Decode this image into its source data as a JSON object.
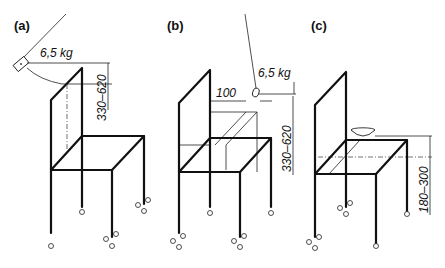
{
  "panels": [
    {
      "id": "a",
      "label": "(a)",
      "load": "6,5 kg",
      "height_range": "330–620"
    },
    {
      "id": "b",
      "label": "(b)",
      "load": "6,5 kg",
      "offset": "100",
      "height_range": "330–620"
    },
    {
      "id": "c",
      "label": "(c)",
      "height_range": "180–300"
    }
  ]
}
